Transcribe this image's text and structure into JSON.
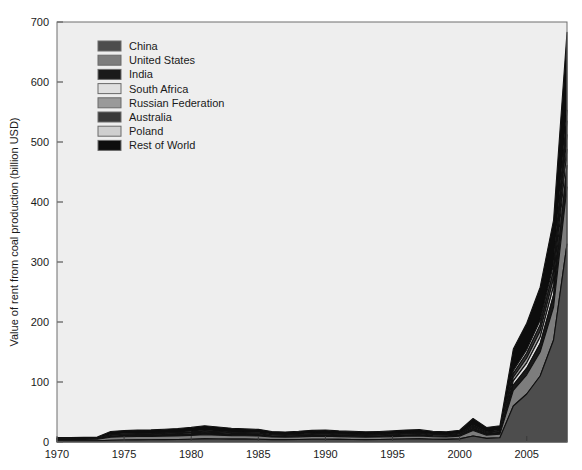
{
  "chart_data": {
    "type": "area",
    "stacked": true,
    "title": "",
    "xlabel": "",
    "ylabel": "Value of rent from coal production (billion USD)",
    "xlim": [
      1970,
      2008
    ],
    "ylim": [
      0,
      700
    ],
    "yticks": [
      0,
      100,
      200,
      300,
      400,
      500,
      600,
      700
    ],
    "xticks": [
      1970,
      1975,
      1980,
      1985,
      1990,
      1995,
      2000,
      2005
    ],
    "grid": false,
    "legend_position": "upper-left",
    "x": [
      1970,
      1971,
      1972,
      1973,
      1974,
      1975,
      1976,
      1977,
      1978,
      1979,
      1980,
      1981,
      1982,
      1983,
      1984,
      1985,
      1986,
      1987,
      1988,
      1989,
      1990,
      1991,
      1992,
      1993,
      1994,
      1995,
      1996,
      1997,
      1998,
      1999,
      2000,
      2001,
      2002,
      2003,
      2004,
      2005,
      2006,
      2007,
      2008
    ],
    "series": [
      {
        "name": "China",
        "color": "#4d4d4d",
        "values": [
          2.0,
          2.0,
          2.1,
          2.2,
          3.0,
          3.4,
          3.6,
          3.8,
          4.0,
          4.2,
          4.6,
          5.2,
          5.0,
          4.8,
          4.8,
          4.6,
          4.0,
          4.0,
          4.2,
          4.6,
          4.6,
          4.4,
          4.2,
          4.0,
          4.2,
          4.6,
          5.0,
          5.2,
          4.6,
          4.4,
          5.2,
          10.0,
          6.0,
          7.0,
          60.0,
          80.0,
          110.0,
          170.0,
          330.0
        ]
      },
      {
        "name": "United States",
        "color": "#7d7d7d",
        "values": [
          2.2,
          2.2,
          2.3,
          2.4,
          5.0,
          5.4,
          5.6,
          5.6,
          5.8,
          6.0,
          6.4,
          7.0,
          6.4,
          5.8,
          5.6,
          5.4,
          4.4,
          4.2,
          4.4,
          4.8,
          5.0,
          4.6,
          4.4,
          4.2,
          4.2,
          4.4,
          4.6,
          4.8,
          4.2,
          4.0,
          4.6,
          9.0,
          5.4,
          6.0,
          26.0,
          32.0,
          40.0,
          55.0,
          95.0
        ]
      },
      {
        "name": "India",
        "color": "#1a1a1a",
        "values": [
          0.5,
          0.5,
          0.5,
          0.6,
          1.2,
          1.3,
          1.4,
          1.4,
          1.5,
          1.6,
          1.7,
          1.9,
          1.8,
          1.6,
          1.5,
          1.5,
          1.2,
          1.1,
          1.2,
          1.3,
          1.4,
          1.3,
          1.2,
          1.2,
          1.2,
          1.3,
          1.3,
          1.4,
          1.2,
          1.1,
          1.3,
          2.6,
          1.6,
          1.8,
          9.0,
          11.0,
          14.0,
          20.0,
          36.0
        ]
      },
      {
        "name": "South Africa",
        "color": "#e0e0e0",
        "values": [
          0.3,
          0.3,
          0.3,
          0.4,
          0.9,
          1.0,
          1.0,
          1.0,
          1.1,
          1.2,
          1.3,
          1.5,
          1.4,
          1.2,
          1.1,
          1.1,
          0.9,
          0.8,
          0.9,
          1.0,
          1.0,
          0.9,
          0.9,
          0.8,
          0.9,
          0.9,
          1.0,
          1.0,
          0.9,
          0.8,
          0.9,
          1.9,
          1.2,
          1.3,
          7.0,
          9.0,
          11.0,
          15.0,
          27.0
        ]
      },
      {
        "name": "Russian Federation",
        "color": "#9a9a9a",
        "values": [
          0.3,
          0.3,
          0.3,
          0.3,
          0.8,
          0.9,
          0.9,
          0.9,
          1.0,
          1.1,
          1.2,
          1.3,
          1.2,
          1.1,
          1.0,
          1.0,
          0.8,
          0.8,
          0.8,
          0.9,
          0.9,
          0.8,
          0.8,
          0.8,
          0.8,
          0.8,
          0.9,
          0.9,
          0.8,
          0.7,
          0.8,
          1.7,
          1.1,
          1.2,
          6.0,
          8.0,
          10.0,
          13.0,
          24.0
        ]
      },
      {
        "name": "Australia",
        "color": "#3a3a3a",
        "values": [
          0.3,
          0.3,
          0.3,
          0.3,
          0.8,
          0.8,
          0.9,
          0.9,
          0.9,
          1.0,
          1.1,
          1.2,
          1.1,
          1.0,
          0.9,
          0.9,
          0.8,
          0.7,
          0.8,
          0.8,
          0.9,
          0.8,
          0.8,
          0.7,
          0.8,
          0.8,
          0.8,
          0.9,
          0.7,
          0.7,
          0.8,
          1.6,
          1.0,
          1.1,
          6.0,
          8.0,
          10.0,
          13.0,
          23.0
        ]
      },
      {
        "name": "Poland",
        "color": "#cfcfcf",
        "values": [
          0.3,
          0.3,
          0.3,
          0.3,
          0.7,
          0.8,
          0.8,
          0.8,
          0.9,
          0.9,
          1.0,
          1.1,
          1.0,
          0.9,
          0.9,
          0.8,
          0.7,
          0.7,
          0.7,
          0.8,
          0.8,
          0.7,
          0.7,
          0.7,
          0.7,
          0.7,
          0.8,
          0.8,
          0.7,
          0.6,
          0.7,
          1.4,
          0.9,
          1.0,
          5.0,
          6.0,
          8.0,
          10.0,
          18.0
        ]
      },
      {
        "name": "Rest of World",
        "color": "#0d0d0d",
        "values": [
          1.6,
          1.6,
          1.7,
          1.8,
          5.0,
          5.4,
          5.6,
          5.8,
          6.0,
          6.4,
          7.0,
          7.8,
          7.0,
          6.4,
          6.0,
          5.8,
          4.6,
          4.4,
          4.8,
          5.2,
          5.4,
          5.0,
          4.8,
          4.6,
          4.8,
          5.0,
          5.4,
          5.6,
          4.8,
          4.6,
          5.4,
          11.0,
          7.0,
          7.6,
          36.0,
          44.0,
          55.0,
          74.0,
          130.0
        ]
      }
    ]
  },
  "legend": {
    "items": [
      {
        "label": "China"
      },
      {
        "label": "United States"
      },
      {
        "label": "India"
      },
      {
        "label": "South Africa"
      },
      {
        "label": "Russian Federation"
      },
      {
        "label": "Australia"
      },
      {
        "label": "Poland"
      },
      {
        "label": "Rest of World"
      }
    ]
  },
  "axes": {
    "y_title": "Value of rent from coal production (billion USD)",
    "y_tick_labels": [
      "0",
      "100",
      "200",
      "300",
      "400",
      "500",
      "600",
      "700"
    ],
    "x_tick_labels": [
      "1970",
      "1975",
      "1980",
      "1985",
      "1990",
      "1995",
      "2000",
      "2005"
    ]
  },
  "style": {
    "plot_background": "#eeeeee",
    "figure_background": "#ffffff",
    "border_color": "#6e6e6e",
    "text_color": "#1a1a1a"
  }
}
